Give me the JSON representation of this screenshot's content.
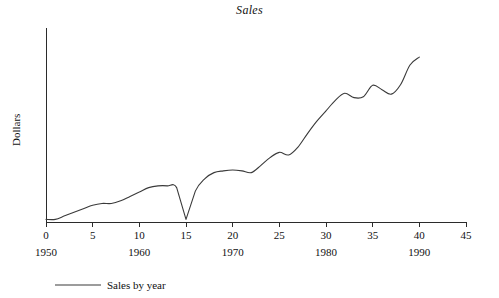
{
  "chart_data": {
    "type": "line",
    "title": "Sales",
    "xlabel": "",
    "ylabel": "Dollars",
    "xlim": [
      0,
      45
    ],
    "ylim": [
      0,
      22
    ],
    "grid": false,
    "legend_position": "bottom-left",
    "xtick_labels": [
      "0",
      "5",
      "10",
      "15",
      "20",
      "25",
      "30",
      "35",
      "40",
      "45"
    ],
    "xtick_values": [
      0,
      5,
      10,
      15,
      20,
      25,
      30,
      35,
      40,
      45
    ],
    "secondary_xtick_labels": [
      "1950",
      "1960",
      "1970",
      "1980",
      "1990"
    ],
    "secondary_xtick_values": [
      0,
      10,
      20,
      30,
      40
    ],
    "yaxis_ticks_shown": false,
    "series": [
      {
        "name": "Sales by year",
        "color": "#3a3a3a",
        "x": [
          0,
          1,
          2,
          3,
          4,
          5,
          6,
          7,
          8,
          9,
          10,
          11,
          12,
          13,
          14,
          15,
          16,
          17,
          18,
          19,
          20,
          21,
          22,
          23,
          24,
          25,
          26,
          27,
          28,
          29,
          30,
          31,
          32,
          33,
          34,
          35,
          36,
          37,
          38,
          39,
          40
        ],
        "values": [
          0.3,
          0.3,
          0.7,
          1.1,
          1.5,
          1.9,
          2.1,
          2.1,
          2.4,
          2.9,
          3.4,
          3.9,
          4.1,
          4.1,
          3.9,
          0.3,
          3.5,
          4.9,
          5.6,
          5.8,
          5.9,
          5.8,
          5.6,
          6.4,
          7.3,
          7.9,
          7.6,
          8.5,
          10.0,
          11.4,
          12.6,
          13.8,
          14.6,
          14.1,
          14.2,
          15.5,
          15.0,
          14.5,
          15.6,
          17.8,
          18.7
        ]
      }
    ]
  },
  "legend": {
    "entries": [
      {
        "label": "Sales by year",
        "color": "#3a3a3a"
      }
    ]
  },
  "axes": {
    "y_axis_label": "Dollars"
  }
}
